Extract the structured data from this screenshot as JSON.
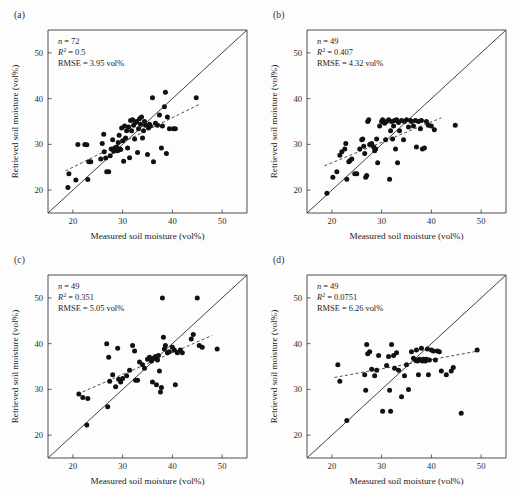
{
  "figure": {
    "background_color": "#fdfdfd",
    "marker_color": "#111111",
    "line_color": "#2b2b2b",
    "axis_color": "#3b3b3b"
  },
  "axes_common": {
    "xlabel": "Measured soil moisture (vol%)",
    "ylabel": "Retrieved soil moisture (vol%)",
    "xticks": [
      20,
      30,
      40,
      50
    ],
    "yticks": [
      20,
      30,
      40,
      50
    ],
    "xlim": [
      15,
      55
    ],
    "ylim": [
      15,
      55
    ],
    "grid": false,
    "identity_line_label": "1:1 line",
    "fit_line_label": "linear fit"
  },
  "chart_data": [
    {
      "type": "scatter",
      "panel": "(a)",
      "title": "",
      "xlabel": "Measured soil moisture (vol%)",
      "ylabel": "Retrieved soil moisture (vol%)",
      "xlim": [
        15,
        55
      ],
      "ylim": [
        15,
        55
      ],
      "xticks": [
        20,
        30,
        40,
        50
      ],
      "yticks": [
        20,
        30,
        40,
        50
      ],
      "grid": false,
      "stats": {
        "n_label": "n",
        "n_value": "72",
        "r2_label": "R",
        "r2_exponent": "2",
        "r2_value": "0.5",
        "rmse_label": "RMSE",
        "rmse_value": "3.95 vol%",
        "n_text": "n = 72",
        "r2_text": "R2 = 0.5",
        "rmse_text": "RMSE = 3.95 vol%"
      },
      "identity_line": {
        "x": [
          15,
          55
        ],
        "y": [
          15,
          55
        ]
      },
      "fit_line": {
        "x": [
          18.5,
          45.5
        ],
        "y": [
          24.2,
          38.8
        ]
      },
      "points": [
        [
          19.0,
          20.6
        ],
        [
          19.2,
          23.6
        ],
        [
          20.6,
          22.2
        ],
        [
          21.0,
          30.0
        ],
        [
          22.4,
          30.0
        ],
        [
          22.8,
          29.9
        ],
        [
          23.0,
          22.3
        ],
        [
          23.2,
          26.2
        ],
        [
          23.6,
          26.2
        ],
        [
          25.6,
          26.8
        ],
        [
          25.9,
          30.2
        ],
        [
          26.2,
          32.2
        ],
        [
          26.3,
          28.4
        ],
        [
          26.6,
          27.0
        ],
        [
          26.8,
          24.0
        ],
        [
          27.2,
          24.0
        ],
        [
          27.5,
          27.5
        ],
        [
          27.7,
          29.0
        ],
        [
          28.0,
          31.0
        ],
        [
          28.2,
          28.5
        ],
        [
          28.4,
          29.2
        ],
        [
          28.6,
          28.8
        ],
        [
          28.8,
          29.4
        ],
        [
          29.0,
          28.6
        ],
        [
          29.1,
          30.4
        ],
        [
          29.3,
          32.0
        ],
        [
          29.4,
          29.0
        ],
        [
          29.6,
          28.9
        ],
        [
          29.8,
          33.6
        ],
        [
          30.0,
          30.8
        ],
        [
          30.2,
          26.3
        ],
        [
          30.4,
          34.0
        ],
        [
          30.6,
          31.4
        ],
        [
          30.8,
          33.0
        ],
        [
          31.0,
          29.2
        ],
        [
          31.2,
          33.8
        ],
        [
          31.4,
          27.1
        ],
        [
          31.6,
          35.2
        ],
        [
          31.8,
          33.0
        ],
        [
          32.0,
          35.4
        ],
        [
          32.2,
          34.2
        ],
        [
          32.4,
          31.2
        ],
        [
          32.6,
          34.8
        ],
        [
          32.8,
          35.0
        ],
        [
          33.0,
          28.2
        ],
        [
          33.2,
          33.4
        ],
        [
          33.4,
          35.6
        ],
        [
          33.6,
          34.4
        ],
        [
          33.8,
          36.0
        ],
        [
          34.0,
          31.4
        ],
        [
          34.2,
          33.0
        ],
        [
          34.4,
          35.0
        ],
        [
          34.6,
          34.2
        ],
        [
          35.0,
          27.8
        ],
        [
          35.2,
          33.6
        ],
        [
          35.4,
          34.4
        ],
        [
          35.6,
          34.0
        ],
        [
          36.0,
          40.2
        ],
        [
          36.2,
          26.2
        ],
        [
          36.6,
          34.6
        ],
        [
          37.0,
          34.2
        ],
        [
          37.4,
          36.4
        ],
        [
          37.8,
          29.2
        ],
        [
          38.0,
          34.0
        ],
        [
          38.4,
          38.2
        ],
        [
          38.6,
          41.4
        ],
        [
          38.8,
          28.0
        ],
        [
          39.0,
          36.0
        ],
        [
          39.4,
          33.4
        ],
        [
          40.2,
          33.4
        ],
        [
          40.6,
          33.4
        ],
        [
          44.8,
          40.2
        ]
      ]
    },
    {
      "type": "scatter",
      "panel": "(b)",
      "title": "",
      "xlabel": "Measured soil moisture (vol%)",
      "ylabel": "Retrieved soil moisture (vol%)",
      "xlim": [
        15,
        55
      ],
      "ylim": [
        15,
        55
      ],
      "xticks": [
        20,
        30,
        40,
        50
      ],
      "yticks": [
        20,
        30,
        40,
        50
      ],
      "grid": false,
      "stats": {
        "n_label": "n",
        "n_value": "49",
        "r2_label": "R",
        "r2_exponent": "2",
        "r2_value": "0.407",
        "rmse_label": "RMSE",
        "rmse_value": "4.32 vol%",
        "n_text": "n = 49",
        "r2_text": "R2 = 0.407",
        "rmse_text": "RMSE = 4.32 vol%"
      },
      "identity_line": {
        "x": [
          15,
          55
        ],
        "y": [
          15,
          55
        ]
      },
      "fit_line": {
        "x": [
          18.5,
          42.0
        ],
        "y": [
          25.3,
          35.8
        ]
      },
      "points": [
        [
          19.0,
          19.3
        ],
        [
          20.2,
          22.8
        ],
        [
          21.0,
          24.0
        ],
        [
          21.6,
          27.6
        ],
        [
          22.0,
          28.4
        ],
        [
          22.6,
          29.0
        ],
        [
          22.8,
          30.2
        ],
        [
          23.0,
          22.4
        ],
        [
          23.4,
          26.2
        ],
        [
          23.6,
          26.4
        ],
        [
          24.0,
          26.8
        ],
        [
          24.6,
          23.6
        ],
        [
          25.0,
          23.6
        ],
        [
          25.6,
          29.0
        ],
        [
          26.0,
          31.0
        ],
        [
          26.2,
          31.2
        ],
        [
          26.4,
          29.6
        ],
        [
          26.6,
          28.0
        ],
        [
          26.8,
          22.8
        ],
        [
          27.0,
          23.2
        ],
        [
          27.2,
          35.0
        ],
        [
          27.4,
          35.4
        ],
        [
          27.6,
          30.0
        ],
        [
          28.0,
          30.2
        ],
        [
          28.4,
          29.4
        ],
        [
          28.6,
          28.6
        ],
        [
          28.8,
          29.0
        ],
        [
          29.0,
          31.2
        ],
        [
          29.2,
          26.0
        ],
        [
          29.6,
          34.0
        ],
        [
          30.0,
          35.0
        ],
        [
          30.2,
          35.4
        ],
        [
          30.6,
          34.6
        ],
        [
          30.8,
          31.0
        ],
        [
          31.0,
          35.0
        ],
        [
          31.4,
          35.4
        ],
        [
          31.6,
          22.4
        ],
        [
          31.8,
          33.0
        ],
        [
          32.0,
          35.0
        ],
        [
          32.2,
          31.2
        ],
        [
          32.4,
          34.0
        ],
        [
          32.6,
          35.2
        ],
        [
          32.8,
          29.0
        ],
        [
          33.0,
          35.4
        ],
        [
          33.2,
          26.0
        ],
        [
          33.4,
          34.8
        ],
        [
          33.6,
          33.0
        ],
        [
          34.0,
          35.2
        ],
        [
          34.4,
          31.0
        ],
        [
          34.6,
          35.0
        ],
        [
          35.0,
          35.4
        ],
        [
          35.4,
          33.8
        ],
        [
          35.8,
          35.2
        ],
        [
          36.0,
          35.0
        ],
        [
          36.4,
          34.0
        ],
        [
          36.8,
          35.2
        ],
        [
          37.0,
          29.4
        ],
        [
          37.4,
          35.0
        ],
        [
          37.8,
          33.4
        ],
        [
          38.0,
          35.2
        ],
        [
          38.2,
          29.0
        ],
        [
          38.6,
          29.2
        ],
        [
          39.0,
          35.0
        ],
        [
          39.4,
          34.2
        ],
        [
          40.0,
          34.0
        ],
        [
          40.6,
          33.2
        ],
        [
          44.8,
          34.2
        ]
      ]
    },
    {
      "type": "scatter",
      "panel": "(c)",
      "title": "",
      "xlabel": "Measured soil moisture (vol%)",
      "ylabel": "Retrieved soil moisture (vol%)",
      "xlim": [
        15,
        55
      ],
      "ylim": [
        15,
        55
      ],
      "xticks": [
        20,
        30,
        40,
        50
      ],
      "yticks": [
        20,
        30,
        40,
        50
      ],
      "grid": false,
      "stats": {
        "n_label": "n",
        "n_value": "49",
        "r2_label": "R",
        "r2_exponent": "2",
        "r2_value": "0.351",
        "rmse_label": "RMSE",
        "rmse_value": "5.05 vol%",
        "n_text": "n = 49",
        "r2_text": "R2 = 0.351",
        "rmse_text": "RMSE = 5.05 vol%"
      },
      "identity_line": {
        "x": [
          15,
          55
        ],
        "y": [
          15,
          55
        ]
      },
      "fit_line": {
        "x": [
          21.0,
          48.0
        ],
        "y": [
          29.0,
          41.8
        ]
      },
      "points": [
        [
          21.2,
          29.0
        ],
        [
          22.0,
          28.2
        ],
        [
          22.8,
          22.2
        ],
        [
          23.0,
          28.0
        ],
        [
          26.8,
          40.0
        ],
        [
          27.0,
          26.2
        ],
        [
          27.2,
          37.0
        ],
        [
          27.4,
          31.8
        ],
        [
          28.0,
          33.2
        ],
        [
          28.6,
          30.6
        ],
        [
          29.0,
          39.0
        ],
        [
          29.2,
          32.2
        ],
        [
          29.6,
          31.6
        ],
        [
          30.0,
          32.4
        ],
        [
          30.8,
          33.0
        ],
        [
          31.4,
          34.2
        ],
        [
          32.0,
          39.6
        ],
        [
          32.4,
          38.4
        ],
        [
          32.6,
          32.0
        ],
        [
          33.0,
          32.0
        ],
        [
          33.4,
          36.0
        ],
        [
          34.0,
          35.4
        ],
        [
          34.4,
          34.6
        ],
        [
          35.0,
          36.6
        ],
        [
          35.4,
          37.0
        ],
        [
          35.8,
          36.2
        ],
        [
          36.0,
          31.6
        ],
        [
          36.2,
          36.8
        ],
        [
          36.6,
          37.2
        ],
        [
          36.8,
          31.0
        ],
        [
          37.0,
          36.4
        ],
        [
          37.2,
          37.4
        ],
        [
          37.4,
          34.0
        ],
        [
          37.6,
          29.4
        ],
        [
          37.8,
          30.4
        ],
        [
          38.0,
          50.0
        ],
        [
          38.2,
          41.4
        ],
        [
          38.4,
          38.8
        ],
        [
          38.6,
          39.6
        ],
        [
          39.0,
          38.0
        ],
        [
          39.4,
          38.2
        ],
        [
          40.0,
          39.2
        ],
        [
          40.4,
          38.6
        ],
        [
          40.6,
          31.0
        ],
        [
          41.0,
          38.0
        ],
        [
          41.6,
          38.6
        ],
        [
          42.0,
          38.0
        ],
        [
          43.8,
          41.0
        ],
        [
          44.2,
          42.0
        ],
        [
          45.0,
          50.0
        ],
        [
          45.4,
          39.6
        ],
        [
          46.0,
          39.2
        ],
        [
          49.0,
          38.8
        ]
      ]
    },
    {
      "type": "scatter",
      "panel": "(d)",
      "title": "",
      "xlabel": "Measured soil moisture (vol%)",
      "ylabel": "Retrieved soil moisture (vol%)",
      "xlim": [
        15,
        55
      ],
      "ylim": [
        15,
        55
      ],
      "xticks": [
        20,
        30,
        40,
        50
      ],
      "yticks": [
        20,
        30,
        40,
        50
      ],
      "grid": false,
      "stats": {
        "n_label": "n",
        "n_value": "49",
        "r2_label": "R",
        "r2_exponent": "2",
        "r2_value": "0.0751",
        "rmse_label": "RMSE",
        "rmse_value": "6.26 vol%",
        "n_text": "n = 49",
        "r2_text": "R2 = 0.0751",
        "rmse_text": "RMSE = 6.26 vol%"
      },
      "identity_line": {
        "x": [
          15,
          55
        ],
        "y": [
          15,
          55
        ]
      },
      "fit_line": {
        "x": [
          20.5,
          49.5
        ],
        "y": [
          32.6,
          38.4
        ]
      },
      "points": [
        [
          21.2,
          35.4
        ],
        [
          21.6,
          31.8
        ],
        [
          23.0,
          23.2
        ],
        [
          26.6,
          33.2
        ],
        [
          26.8,
          29.8
        ],
        [
          27.0,
          39.8
        ],
        [
          27.2,
          37.8
        ],
        [
          27.6,
          38.2
        ],
        [
          28.0,
          34.4
        ],
        [
          28.6,
          33.0
        ],
        [
          29.0,
          34.2
        ],
        [
          29.4,
          37.4
        ],
        [
          30.2,
          25.2
        ],
        [
          31.0,
          35.2
        ],
        [
          31.4,
          37.2
        ],
        [
          31.6,
          29.8
        ],
        [
          31.8,
          25.2
        ],
        [
          32.0,
          39.8
        ],
        [
          32.4,
          37.4
        ],
        [
          32.6,
          34.6
        ],
        [
          33.0,
          38.0
        ],
        [
          33.4,
          34.2
        ],
        [
          34.0,
          28.4
        ],
        [
          34.6,
          33.0
        ],
        [
          35.0,
          35.4
        ],
        [
          35.4,
          30.0
        ],
        [
          36.0,
          38.2
        ],
        [
          36.4,
          36.8
        ],
        [
          36.8,
          36.4
        ],
        [
          37.0,
          38.6
        ],
        [
          37.2,
          36.2
        ],
        [
          37.4,
          33.2
        ],
        [
          37.6,
          36.6
        ],
        [
          37.8,
          36.4
        ],
        [
          38.0,
          39.0
        ],
        [
          38.2,
          36.2
        ],
        [
          38.4,
          36.6
        ],
        [
          38.6,
          36.4
        ],
        [
          38.8,
          36.2
        ],
        [
          39.0,
          36.6
        ],
        [
          39.2,
          38.8
        ],
        [
          39.4,
          33.2
        ],
        [
          39.6,
          36.4
        ],
        [
          40.0,
          38.6
        ],
        [
          40.4,
          38.4
        ],
        [
          40.8,
          36.4
        ],
        [
          41.2,
          38.4
        ],
        [
          41.6,
          38.2
        ],
        [
          42.0,
          34.0
        ],
        [
          43.0,
          33.2
        ],
        [
          44.0,
          34.0
        ],
        [
          44.4,
          34.8
        ],
        [
          46.0,
          24.8
        ],
        [
          49.2,
          38.6
        ]
      ]
    }
  ]
}
